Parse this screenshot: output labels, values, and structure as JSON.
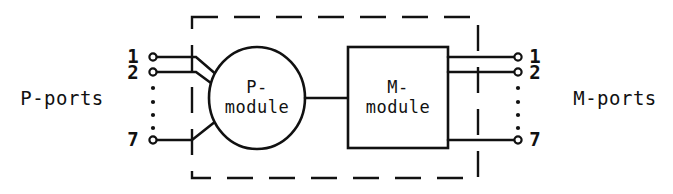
{
  "figure": {
    "background_color": "#ffffff",
    "line_color": "#111111"
  },
  "left_group": {
    "label": "P-ports",
    "ports": [
      {
        "number": "1"
      },
      {
        "number": "2"
      },
      {
        "number": "7"
      }
    ],
    "ellipsis": "vertical-dots"
  },
  "right_group": {
    "label": "M-ports",
    "ports": [
      {
        "number": "1"
      },
      {
        "number": "2"
      },
      {
        "number": "7"
      }
    ],
    "ellipsis": "vertical-dots"
  },
  "modules": {
    "p_module": {
      "shape": "ellipse",
      "line1": "P-",
      "line2": "module"
    },
    "m_module": {
      "shape": "rectangle",
      "line1": "M-",
      "line2": "module"
    }
  },
  "boundary": {
    "style": "dashed",
    "name": "system-boundary"
  }
}
